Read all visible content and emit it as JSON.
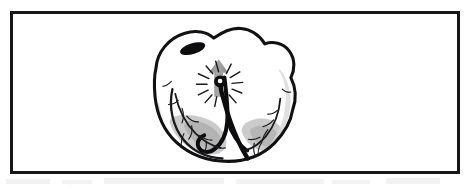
{
  "figure": {
    "alt_description": "Line drawing of a heart viewed from the front with a pacing lead entering the right ventricle, an electrode tip emitting a burst of radiating lines, and a gray arrow pointing upward",
    "frame": {
      "border_color": "#17171a",
      "border_width_px": 3,
      "background_color": "#ffffff",
      "x": 10,
      "y": 11,
      "width": 450,
      "height": 163
    },
    "elements": [
      {
        "name": "heart-outline",
        "label": "Heart",
        "stroke_color": "#111113",
        "fill_color": "#ffffff"
      },
      {
        "name": "vessel-ostium",
        "label": "Vessel ostium",
        "fill_color": "#0d0d0f"
      },
      {
        "name": "pacing-lead",
        "label": "Pacing lead",
        "stroke_color": "#0d0d0f"
      },
      {
        "name": "electrode-tip",
        "label": "Electrode tip",
        "fill_color": "#0d0d0f"
      },
      {
        "name": "stimulation-burst",
        "label": "Stimulation burst",
        "stroke_color": "#1a1a1c"
      },
      {
        "name": "direction-arrow",
        "label": "Direction of impulse",
        "fill_color": "#9a9a9a"
      },
      {
        "name": "coronary-vessels",
        "label": "Coronary vessels",
        "stroke_color": "#1a1a1c"
      },
      {
        "name": "ventricular-shading",
        "label": "Ventricular shading",
        "fill_color": "#b5b5b5"
      }
    ],
    "colors": {
      "ink": "#111113",
      "frame": "#17171a",
      "gray_arrow": "#9a9a9a",
      "gray_shadow": "#b8b8b8",
      "gray_shadow_light": "#d2d2d2",
      "paper": "#ffffff",
      "artifact": "#f0f0f1"
    }
  }
}
